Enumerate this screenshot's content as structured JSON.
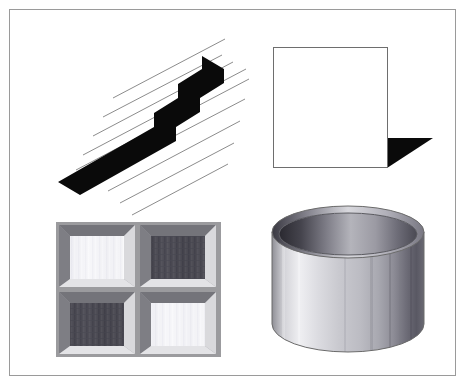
{
  "figure": {
    "background_color": "#ffffff",
    "frame_color": "#9a9a9a",
    "frame": {
      "x": 9,
      "y": 9,
      "width": 447,
      "height": 367
    },
    "panel_count": 4
  },
  "panels": [
    {
      "id": "zigzag",
      "position": "top-left",
      "name": "hatched-zigzag-bar",
      "description": "Black zigzag / stepped band crossed by thin parallel diagonal hatch lines",
      "shape_color": "#0a0a0a",
      "hatch_color": "#8c8c8c",
      "hatch_line_count": 9,
      "hatch_angle_deg": 28,
      "hatch_line_width": 1
    },
    {
      "id": "square",
      "position": "top-right",
      "name": "square-with-cast-shadow",
      "description": "Outlined white square with a solid black triangular shadow at its lower-right corner",
      "fill_color": "#ffffff",
      "outline_color": "#6e6e6e",
      "outline_width": 1,
      "shadow_color": "#0a0a0a",
      "square_size_px": 120
    },
    {
      "id": "tiles",
      "position": "bottom-left",
      "name": "beveled-checker-tiles",
      "description": "Two-by-two array of beveled recessed tiles alternating light and dark fills",
      "rows": 2,
      "columns": 2,
      "tile_fills": [
        [
          "light",
          "dark"
        ],
        [
          "dark",
          "light"
        ]
      ],
      "light_fill_color": "#f2f2f5",
      "dark_fill_color": "#4b4a52",
      "bevel_top_color": "#6f6f74",
      "bevel_bottom_color": "#d6d6d8",
      "plate_color": "#9b9b9e"
    },
    {
      "id": "cylinder",
      "position": "bottom-right",
      "name": "shaded-open-cylinder",
      "description": "Open-topped cylinder rendered with a smooth light-to-dark gradient body and a dark inner rim",
      "body_light_color": "#f4f4f4",
      "body_mid_color": "#b9b9bd",
      "body_dark_color": "#55545c",
      "rim_dark_color": "#2d2c33",
      "outline_color": "#6a6a6a"
    }
  ]
}
